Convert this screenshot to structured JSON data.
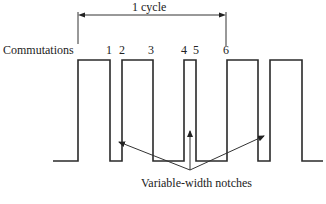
{
  "diagram": {
    "cycle_label": "1 cycle",
    "commutations_label": "Commutations",
    "commutation_numbers": [
      "1",
      "2",
      "3",
      "4",
      "5",
      "6"
    ],
    "notches_label": "Variable-width notches",
    "line_color": "#2a2a2a",
    "waveform": {
      "baseline_y": 161,
      "high_y": 60,
      "segments": [
        {
          "level": "low",
          "x0": 53,
          "x1": 78
        },
        {
          "level": "high",
          "x0": 78,
          "x1": 110
        },
        {
          "level": "low",
          "x0": 110,
          "x1": 122,
          "note": "notch"
        },
        {
          "level": "high",
          "x0": 122,
          "x1": 153
        },
        {
          "level": "low",
          "x0": 153,
          "x1": 184
        },
        {
          "level": "high",
          "x0": 184,
          "x1": 196
        },
        {
          "level": "low",
          "x0": 196,
          "x1": 227
        },
        {
          "level": "high",
          "x0": 227,
          "x1": 258
        },
        {
          "level": "low",
          "x0": 258,
          "x1": 270,
          "note": "notch"
        },
        {
          "level": "high",
          "x0": 270,
          "x1": 302
        },
        {
          "level": "low",
          "x0": 302,
          "x1": 323
        }
      ]
    }
  }
}
